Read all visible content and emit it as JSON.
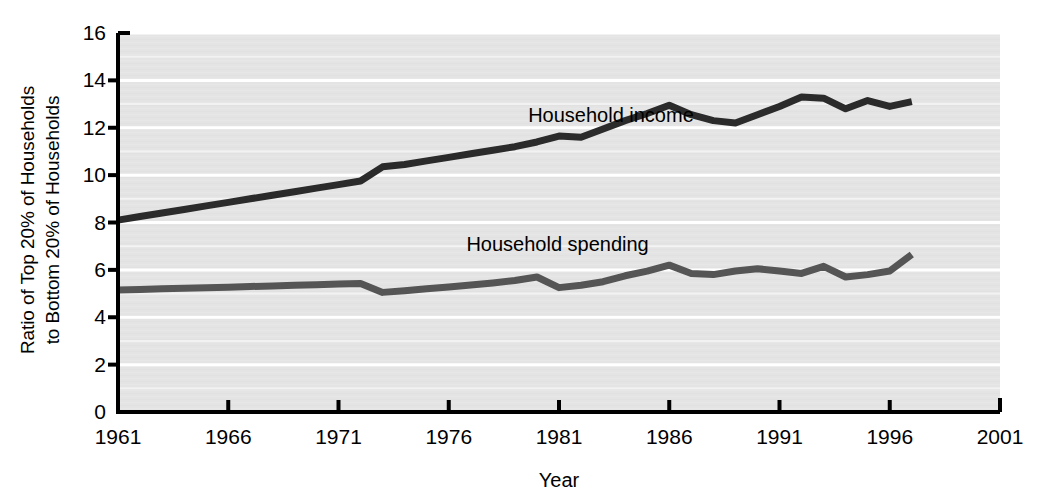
{
  "chart_data": {
    "type": "line",
    "title": "",
    "xlabel": "Year",
    "ylabel_line1": "Ratio of Top 20% of Households",
    "ylabel_line2": "to Bottom 20% of Households",
    "xlim": [
      1961,
      2001
    ],
    "ylim": [
      0,
      16
    ],
    "xticks": [
      1961,
      1966,
      1971,
      1976,
      1981,
      1986,
      1991,
      1996,
      2001
    ],
    "yticks": [
      0,
      2,
      4,
      6,
      8,
      10,
      12,
      14,
      16
    ],
    "grid": "horizontal-white-gridlines",
    "legend": "inline-labels",
    "plot_background": "#e4e4e4",
    "gridline_color": "#ffffff",
    "axis_color": "#000000",
    "series": [
      {
        "name": "Household income",
        "color": "#2b2b2b",
        "label_x": 1979.6,
        "label_y": 12.55,
        "x": [
          1961,
          1962,
          1963,
          1964,
          1965,
          1966,
          1967,
          1968,
          1969,
          1970,
          1971,
          1972,
          1973,
          1974,
          1975,
          1976,
          1977,
          1978,
          1979,
          1980,
          1981,
          1982,
          1983,
          1984,
          1985,
          1986,
          1987,
          1988,
          1989,
          1990,
          1991,
          1992,
          1993,
          1994,
          1995,
          1996,
          1997
        ],
        "values": [
          8.1,
          8.25,
          8.4,
          8.55,
          8.7,
          8.85,
          9.0,
          9.15,
          9.3,
          9.45,
          9.6,
          9.75,
          10.35,
          10.45,
          10.6,
          10.75,
          10.9,
          11.05,
          11.2,
          11.4,
          11.65,
          11.6,
          11.95,
          12.3,
          12.6,
          12.95,
          12.55,
          12.3,
          12.2,
          12.55,
          12.9,
          13.3,
          13.25,
          12.8,
          13.15,
          12.9,
          13.1
        ]
      },
      {
        "name": "Household spending",
        "color": "#555555",
        "label_x": 1976.8,
        "label_y": 7.1,
        "x": [
          1961,
          1962,
          1963,
          1964,
          1965,
          1966,
          1967,
          1968,
          1969,
          1970,
          1971,
          1972,
          1973,
          1974,
          1975,
          1976,
          1977,
          1978,
          1979,
          1980,
          1981,
          1982,
          1983,
          1984,
          1985,
          1986,
          1987,
          1988,
          1989,
          1990,
          1991,
          1992,
          1993,
          1994,
          1995,
          1996,
          1997
        ],
        "values": [
          5.15,
          5.17,
          5.2,
          5.22,
          5.25,
          5.27,
          5.3,
          5.32,
          5.35,
          5.37,
          5.4,
          5.42,
          5.05,
          5.12,
          5.2,
          5.28,
          5.36,
          5.45,
          5.55,
          5.7,
          5.25,
          5.35,
          5.5,
          5.75,
          5.95,
          6.2,
          5.85,
          5.8,
          5.95,
          6.05,
          5.95,
          5.85,
          6.15,
          5.7,
          5.8,
          5.95,
          6.65
        ]
      }
    ]
  },
  "axis": {
    "y_tick_labels": [
      "16",
      "14",
      "12",
      "10",
      "8",
      "6",
      "4",
      "2",
      "0"
    ],
    "x_tick_labels": [
      "1961",
      "1966",
      "1971",
      "1976",
      "1981",
      "1986",
      "1991",
      "1996",
      "2001"
    ],
    "x_title": "Year",
    "y_title_line1": "Ratio of Top 20% of Households",
    "y_title_line2": "to Bottom 20% of Households"
  },
  "annotations": {
    "income_label": "Household income",
    "spending_label": "Household spending"
  }
}
